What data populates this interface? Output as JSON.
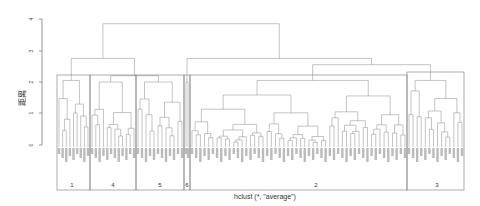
{
  "chart_data": {
    "type": "dendrogram",
    "title": "",
    "xlabel": "hclust (*, \"average\")",
    "ylabel": "距离",
    "ylim": [
      0,
      4
    ],
    "yticks": [
      "0",
      "1",
      "2",
      "3",
      "4"
    ],
    "grid": false,
    "method": "average",
    "clusters": [
      {
        "label": "1",
        "x_start": 57,
        "x_end": 90,
        "leaves": 9,
        "merge_height": 2.05
      },
      {
        "label": "4",
        "x_start": 90,
        "x_end": 136,
        "leaves": 12,
        "merge_height": 2.0
      },
      {
        "label": "5",
        "x_start": 136,
        "x_end": 184,
        "leaves": 12,
        "merge_height": 2.0
      },
      {
        "label": "6",
        "x_start": 184,
        "x_end": 190,
        "leaves": 2,
        "merge_height": 2.0
      },
      {
        "label": "2",
        "x_start": 190,
        "x_end": 407,
        "leaves": 52,
        "merge_height": 2.05
      },
      {
        "label": "3",
        "x_start": 407,
        "x_end": 464,
        "leaves": 14,
        "merge_height": 2.05
      }
    ],
    "top_merges": [
      {
        "height": 3.85,
        "between": [
          "clusters 1,4,5,6",
          "clusters 2,3"
        ]
      },
      {
        "height": 2.75,
        "between": [
          "cluster 1",
          "clusters 4,5,6"
        ]
      },
      {
        "height": 2.75,
        "between": [
          "cluster 6 group",
          "clusters 2,3"
        ]
      },
      {
        "height": 2.55,
        "between": [
          "cluster 2",
          "cluster 3"
        ]
      },
      {
        "height": 2.2,
        "between": [
          "cluster 4",
          "cluster 5"
        ]
      }
    ],
    "rect_hclust_k": 6
  },
  "axis": {
    "y_title": "距离",
    "ticks": [
      "0",
      "1",
      "2",
      "3",
      "4"
    ]
  },
  "footer": {
    "method_label": "hclust (*, \"average\")"
  }
}
